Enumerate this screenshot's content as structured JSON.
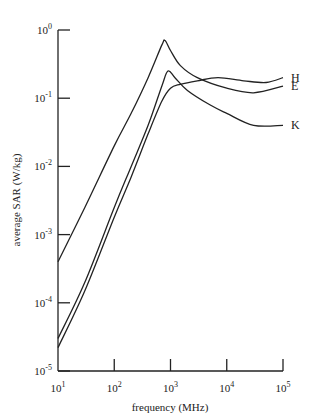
{
  "chart_data": {
    "type": "line",
    "title": "",
    "xlabel": "frequency (MHz)",
    "ylabel": "average SAR (W/kg)",
    "xscale": "log",
    "yscale": "log",
    "xlim": [
      10,
      100000
    ],
    "ylim": [
      1e-05,
      1
    ],
    "grid": false,
    "legend": "inline labels at right end of curves",
    "x_ticks": [
      {
        "base": "10",
        "exp": "1"
      },
      {
        "base": "10",
        "exp": "2"
      },
      {
        "base": "10",
        "exp": "3"
      },
      {
        "base": "10",
        "exp": "4"
      },
      {
        "base": "10",
        "exp": "5"
      }
    ],
    "y_ticks": [
      {
        "base": "10",
        "exp": "0"
      },
      {
        "base": "10",
        "exp": "-1"
      },
      {
        "base": "10",
        "exp": "-2"
      },
      {
        "base": "10",
        "exp": "-3"
      },
      {
        "base": "10",
        "exp": "-4"
      },
      {
        "base": "10",
        "exp": "-5"
      }
    ],
    "series": [
      {
        "name": "E",
        "x": [
          10,
          30,
          100,
          200,
          400,
          700,
          800,
          1000,
          1500,
          3000,
          10000,
          30000,
          100000
        ],
        "y": [
          0.0004,
          0.0025,
          0.02,
          0.06,
          0.2,
          0.6,
          0.7,
          0.5,
          0.3,
          0.2,
          0.14,
          0.12,
          0.15
        ]
      },
      {
        "name": "K",
        "x": [
          10,
          30,
          100,
          200,
          400,
          700,
          900,
          1200,
          2000,
          5000,
          10000,
          30000,
          100000
        ],
        "y": [
          3e-05,
          0.0002,
          0.0025,
          0.01,
          0.04,
          0.15,
          0.25,
          0.2,
          0.13,
          0.08,
          0.06,
          0.04,
          0.04
        ]
      },
      {
        "name": "H",
        "x": [
          10,
          30,
          100,
          200,
          400,
          700,
          1000,
          1500,
          3000,
          7000,
          20000,
          50000,
          100000
        ],
        "y": [
          2.2e-05,
          0.00015,
          0.0018,
          0.007,
          0.03,
          0.09,
          0.14,
          0.16,
          0.18,
          0.2,
          0.18,
          0.17,
          0.2
        ]
      }
    ]
  }
}
